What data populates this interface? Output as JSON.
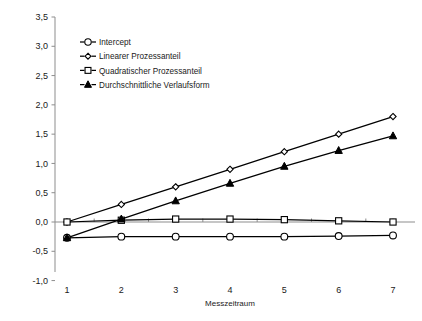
{
  "chart_data": {
    "type": "line",
    "title": "",
    "xlabel": "Messzeitraum",
    "ylabel": "",
    "x": [
      1,
      2,
      3,
      4,
      5,
      6,
      7
    ],
    "categories": [
      "1",
      "2",
      "3",
      "4",
      "5",
      "6",
      "7"
    ],
    "xlim": [
      0.6,
      7.6
    ],
    "ylim": [
      -1.0,
      3.5
    ],
    "yticks": [
      -1.0,
      -0.5,
      0.0,
      0.5,
      1.0,
      1.5,
      2.0,
      2.5,
      3.0,
      3.5
    ],
    "ytick_labels": [
      "-1,0",
      "-0,5",
      "0,0",
      "0,5",
      "1,0",
      "1,5",
      "2,0",
      "2,5",
      "3,0",
      "3,5"
    ],
    "xtick_labels": [
      "1",
      "2",
      "3",
      "4",
      "5",
      "6",
      "7"
    ],
    "grid": false,
    "legend_position": "upper-left-inside",
    "series": [
      {
        "name": "Intercept",
        "marker": "circle-open",
        "values": [
          -0.27,
          -0.25,
          -0.25,
          -0.25,
          -0.25,
          -0.24,
          -0.23
        ]
      },
      {
        "name": "Linearer Prozessanteil",
        "marker": "diamond-open",
        "values": [
          0.0,
          0.3,
          0.6,
          0.9,
          1.2,
          1.5,
          1.8
        ]
      },
      {
        "name": "Quadratischer Prozessanteil",
        "marker": "square-open",
        "values": [
          0.0,
          0.03,
          0.05,
          0.05,
          0.04,
          0.02,
          0.0
        ]
      },
      {
        "name": "Durchschnittliche Verlaufsform",
        "marker": "triangle-filled",
        "values": [
          -0.27,
          0.05,
          0.36,
          0.66,
          0.95,
          1.22,
          1.47
        ]
      }
    ]
  },
  "axis": {
    "x_title": "Messzeitraum"
  },
  "legend": {
    "entries": [
      {
        "label": "Intercept",
        "marker": "circle-open"
      },
      {
        "label": "Linearer Prozessanteil",
        "marker": "diamond-open"
      },
      {
        "label": "Quadratischer Prozessanteil",
        "marker": "square-open"
      },
      {
        "label": "Durchschnittliche Verlaufsform",
        "marker": "triangle-filled"
      }
    ]
  },
  "colors": {
    "line": "#000000",
    "axis": "#8d8d8d",
    "text": "#1a1a1a",
    "marker_fill": "#ffffff",
    "background": "#ffffff"
  }
}
